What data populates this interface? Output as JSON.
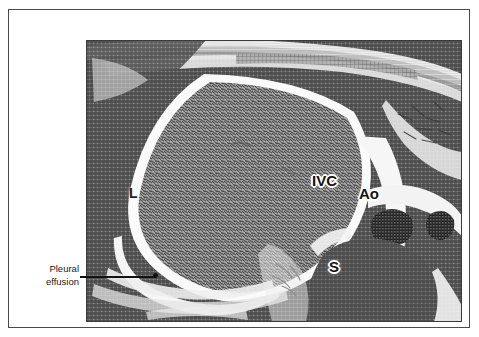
{
  "figure": {
    "kind": "medical-scan-illustration",
    "modality_description": "Transverse abdominal scan, halftone print reproduction",
    "frame_color": "#4a4a4a",
    "background_color": "#ffffff"
  },
  "scan": {
    "labels": [
      {
        "id": "liver",
        "text": "L",
        "meaning": "Liver"
      },
      {
        "id": "inferior-vena-cava",
        "text": "IVC",
        "meaning": "Inferior vena cava"
      },
      {
        "id": "aorta",
        "text": "Ao",
        "meaning": "Aorta"
      },
      {
        "id": "spine",
        "text": "S",
        "meaning": "Spine"
      }
    ],
    "tones": {
      "liver_parenchyma": "#8a8a8a",
      "dark_tissue": "#565656",
      "bright_fluid": "#f2f2f2",
      "plate_background": "#8e8e8e"
    }
  },
  "callout": {
    "line1": "Pleural",
    "line2": "effusion",
    "leader_color": "#111111"
  }
}
